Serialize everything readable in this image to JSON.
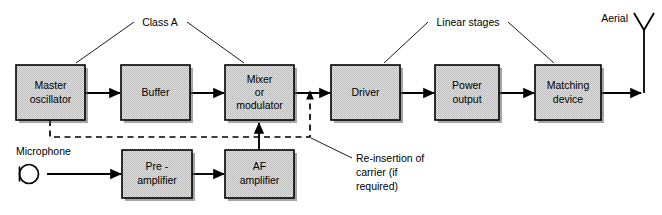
{
  "diagram": {
    "colors": {
      "box_fill": "#d9d9d9",
      "box_stroke": "#000000",
      "background": "#ffffff",
      "shadow": "#5c5c5c"
    },
    "blocks": [
      {
        "id": "master-oscillator",
        "lines": [
          "Master",
          "oscillator"
        ],
        "x": 16,
        "y": 65,
        "w": 69,
        "h": 55
      },
      {
        "id": "buffer",
        "lines": [
          "Buffer"
        ],
        "x": 121,
        "y": 65,
        "w": 69,
        "h": 55
      },
      {
        "id": "mixer-modulator",
        "lines": [
          "Mixer",
          "or",
          "modulator"
        ],
        "x": 225,
        "y": 65,
        "w": 69,
        "h": 55
      },
      {
        "id": "driver",
        "lines": [
          "Driver"
        ],
        "x": 331,
        "y": 65,
        "w": 69,
        "h": 55
      },
      {
        "id": "power-output",
        "lines": [
          "Power",
          "output"
        ],
        "x": 435,
        "y": 65,
        "w": 64,
        "h": 55
      },
      {
        "id": "matching-device",
        "lines": [
          "Matching",
          "device"
        ],
        "x": 535,
        "y": 65,
        "w": 66,
        "h": 55
      },
      {
        "id": "pre-amplifier",
        "lines": [
          "Pre -",
          "amplifier"
        ],
        "x": 122,
        "y": 150,
        "w": 70,
        "h": 48
      },
      {
        "id": "af-amplifier",
        "lines": [
          "AF",
          "amplifier"
        ],
        "x": 225,
        "y": 150,
        "w": 69,
        "h": 48
      }
    ],
    "annotations": {
      "class_a": "Class A",
      "linear_stages": "Linear stages",
      "aerial": "Aerial",
      "microphone": "Microphone",
      "reinsertion": [
        "Re-insertion of",
        "carrier (if",
        "required)"
      ]
    }
  }
}
